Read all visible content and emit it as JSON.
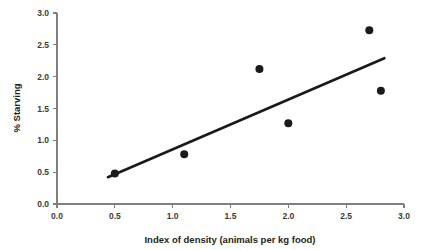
{
  "chart_data": {
    "type": "scatter",
    "title": "",
    "xlabel": "Index of density (animals per kg food)",
    "ylabel": "% Starving",
    "xlim": [
      0.0,
      3.0
    ],
    "ylim": [
      0.0,
      3.0
    ],
    "grid": false,
    "legend": null,
    "x_ticks": [
      "0.0",
      "0.5",
      "1.0",
      "1.5",
      "2.0",
      "2.5",
      "3.0"
    ],
    "x_tick_values": [
      0.0,
      0.5,
      1.0,
      1.5,
      2.0,
      2.5,
      3.0
    ],
    "y_ticks": [
      "0.0",
      "0.5",
      "1.0",
      "1.5",
      "2.0",
      "2.5",
      "3.0"
    ],
    "y_tick_values": [
      0.0,
      0.5,
      1.0,
      1.5,
      2.0,
      2.5,
      3.0
    ],
    "points": [
      {
        "x": 0.5,
        "y": 0.48
      },
      {
        "x": 1.1,
        "y": 0.78
      },
      {
        "x": 1.75,
        "y": 2.12
      },
      {
        "x": 2.0,
        "y": 1.27
      },
      {
        "x": 2.7,
        "y": 2.73
      },
      {
        "x": 2.8,
        "y": 1.78
      }
    ],
    "point_color": "#1a1a1a",
    "point_radius_px": 4,
    "trend_line": {
      "x0": 0.44,
      "y0": 0.42,
      "x1": 2.83,
      "y1": 2.29,
      "color": "#1a1a1a",
      "width_px": 2.6
    },
    "axis_color": "#808080",
    "text_color": "#231f20",
    "background": "#ffffff"
  }
}
